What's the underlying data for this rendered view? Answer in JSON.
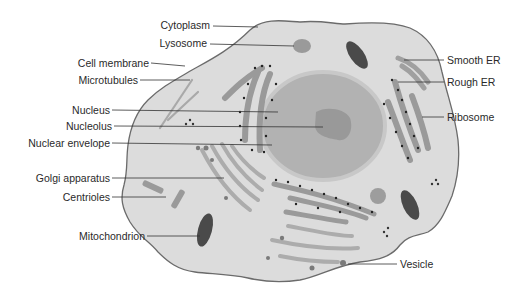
{
  "colors": {
    "cytoplasm": "#dcdcdc",
    "membrane": "#6b6b6b",
    "nucleus": "#a9a9a9",
    "nucleolus": "#9a9a9a",
    "organelle": "#9c9c9c",
    "ribosome": "#222222",
    "label_text": "#2a2a2a",
    "leader_line": "#333333"
  },
  "labels": {
    "left": [
      {
        "id": "cytoplasm",
        "text": "Cytoplasm"
      },
      {
        "id": "lysosome",
        "text": "Lysosome"
      },
      {
        "id": "cell_membrane",
        "text": "Cell membrane"
      },
      {
        "id": "microtubules",
        "text": "Microtubules"
      },
      {
        "id": "nucleus",
        "text": "Nucleus"
      },
      {
        "id": "nucleolus",
        "text": "Nucleolus"
      },
      {
        "id": "nuclear_envelope",
        "text": "Nuclear envelope"
      },
      {
        "id": "golgi_apparatus",
        "text": "Golgi apparatus"
      },
      {
        "id": "centrioles",
        "text": "Centrioles"
      },
      {
        "id": "mitochondrion",
        "text": "Mitochondrion"
      }
    ],
    "right": [
      {
        "id": "smooth_er",
        "text": "Smooth ER"
      },
      {
        "id": "rough_er",
        "text": "Rough ER"
      },
      {
        "id": "ribosome",
        "text": "Ribosome"
      },
      {
        "id": "vesicle",
        "text": "Vesicle"
      }
    ]
  }
}
